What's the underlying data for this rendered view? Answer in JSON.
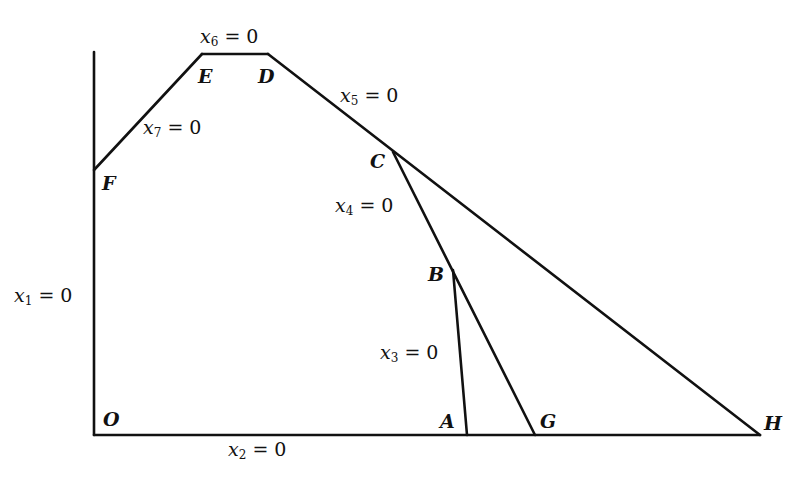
{
  "figure": {
    "points": {
      "O": {
        "label": "O",
        "x": 94,
        "y": 435
      },
      "A": {
        "label": "A",
        "x": 467,
        "y": 435
      },
      "G": {
        "label": "G",
        "x": 535,
        "y": 435
      },
      "H": {
        "label": "H",
        "x": 760,
        "y": 435
      },
      "B": {
        "label": "B",
        "x": 453,
        "y": 270
      },
      "C": {
        "label": "C",
        "x": 393,
        "y": 152
      },
      "D": {
        "label": "D",
        "x": 268,
        "y": 54
      },
      "E": {
        "label": "E",
        "x": 202,
        "y": 54
      },
      "F": {
        "label": "F",
        "x": 94,
        "y": 170
      }
    },
    "constraints": [
      {
        "id": "x1",
        "var": "x",
        "sub": "1",
        "rhs": "= 0",
        "boundary": "vertical axis O–F"
      },
      {
        "id": "x2",
        "var": "x",
        "sub": "2",
        "rhs": "= 0",
        "boundary": "horizontal axis O–H"
      },
      {
        "id": "x3",
        "var": "x",
        "sub": "3",
        "rhs": "= 0",
        "boundary": "A–B"
      },
      {
        "id": "x4",
        "var": "x",
        "sub": "4",
        "rhs": "= 0",
        "boundary": "B–C (extended to G)"
      },
      {
        "id": "x5",
        "var": "x",
        "sub": "5",
        "rhs": "= 0",
        "boundary": "D–C (extended to H)"
      },
      {
        "id": "x6",
        "var": "x",
        "sub": "6",
        "rhs": "= 0",
        "boundary": "E–D"
      },
      {
        "id": "x7",
        "var": "x",
        "sub": "7",
        "rhs": "= 0",
        "boundary": "F–E"
      }
    ],
    "line_color": "#111111",
    "background": "#ffffff"
  }
}
